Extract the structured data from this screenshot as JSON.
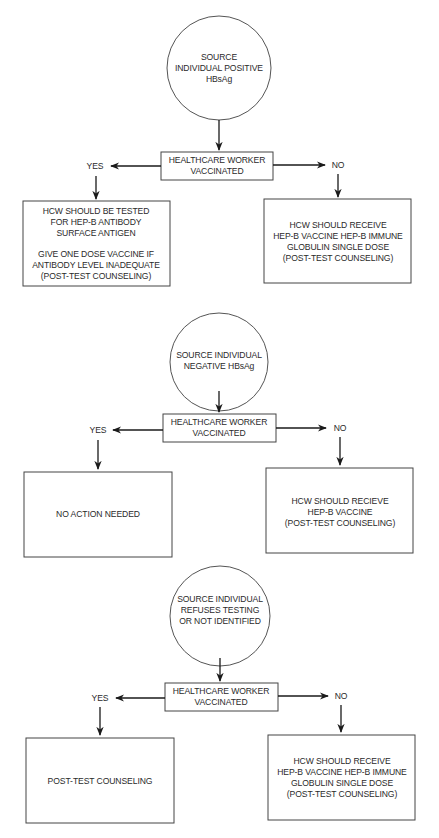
{
  "colors": {
    "background": "#ffffff",
    "stroke": "#444444",
    "text": "#2a2a2a"
  },
  "flows": [
    {
      "source": {
        "lines": [
          "SOURCE",
          "INDIVIDUAL POSITIVE",
          "HBsAg"
        ]
      },
      "decision": {
        "lines": [
          "HEALTHCARE WORKER",
          "VACCINATED"
        ]
      },
      "yes_label": "YES",
      "no_label": "NO",
      "yes_outcome": {
        "lines": [
          "HCW SHOULD BE TESTED",
          "FOR HEP-B ANTIBODY",
          "SURFACE ANTIGEN",
          "",
          "GIVE ONE DOSE VACCINE IF",
          "ANTIBODY LEVEL INADEQUATE",
          "(POST-TEST COUNSELING)"
        ]
      },
      "no_outcome": {
        "lines": [
          "HCW SHOULD RECEIVE",
          "HEP-B VACCINE HEP-B IMMUNE",
          "GLOBULIN SINGLE DOSE",
          "(POST-TEST COUNSELING)"
        ]
      }
    },
    {
      "source": {
        "lines": [
          "SOURCE INDIVIDUAL",
          "NEGATIVE HBsAg"
        ]
      },
      "decision": {
        "lines": [
          "HEALTHCARE WORKER",
          "VACCINATED"
        ]
      },
      "yes_label": "YES",
      "no_label": "NO",
      "yes_outcome": {
        "lines": [
          "NO ACTION NEEDED"
        ]
      },
      "no_outcome": {
        "lines": [
          "HCW SHOULD RECIEVE",
          "HEP-B VACCINE",
          "(POST-TEST COUNSELING)"
        ]
      }
    },
    {
      "source": {
        "lines": [
          "SOURCE INDIVIDUAL",
          "REFUSES TESTING",
          "OR NOT IDENTIFIED"
        ]
      },
      "decision": {
        "lines": [
          "HEALTHCARE WORKER",
          "VACCINATED"
        ]
      },
      "yes_label": "YES",
      "no_label": "NO",
      "yes_outcome": {
        "lines": [
          "POST-TEST COUNSELING"
        ]
      },
      "no_outcome": {
        "lines": [
          "HCW SHOULD RECEIVE",
          "HEP-B VACCINE HEP-B IMMUNE",
          "GLOBULIN SINGLE DOSE",
          "(POST-TEST COUNSELING)"
        ]
      }
    }
  ]
}
